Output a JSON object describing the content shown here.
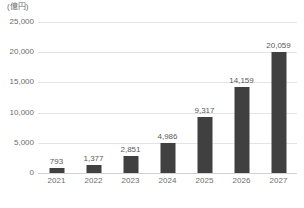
{
  "chart_data": {
    "type": "bar",
    "title": "",
    "subtitle": "",
    "unit_label": "(億円)",
    "xlabel": "",
    "ylabel": "",
    "categories": [
      "2021",
      "2022",
      "2023",
      "2024",
      "2025",
      "2026",
      "2027"
    ],
    "values": [
      793,
      1377,
      2851,
      4986,
      9317,
      14159,
      20059
    ],
    "value_labels": [
      "793",
      "1,377",
      "2,851",
      "4,986",
      "9,317",
      "14,159",
      "20,059"
    ],
    "ylim": [
      0,
      25000
    ],
    "ytick_values": [
      25000,
      20000,
      15000,
      10000,
      5000,
      0
    ],
    "ytick_labels": [
      "25,000",
      "20,000",
      "15,000",
      "10,000",
      "5,000",
      "0"
    ],
    "grid": true,
    "grid_axis": "y",
    "legend": false,
    "legend_position": "none",
    "series": [
      {
        "name": "",
        "values": [
          793,
          1377,
          2851,
          4986,
          9317,
          14159,
          20059
        ]
      }
    ],
    "colors": {
      "bar": "#404040",
      "gridline": "#e4e4e4",
      "baseline": "#d2d2d2",
      "tick_text": "#6d6d6d",
      "value_text": "#5a5a5a",
      "background": "#ffffff"
    }
  }
}
